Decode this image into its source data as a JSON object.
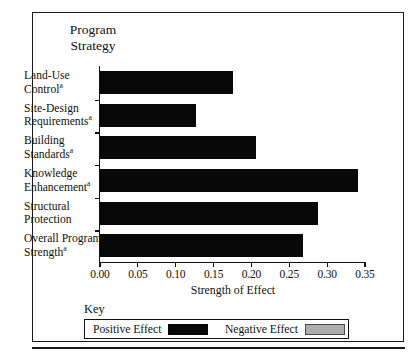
{
  "figure": {
    "corner_title_line1": "Program",
    "corner_title_line2": "Strategy"
  },
  "key": {
    "title": "Key",
    "entries": [
      {
        "label": "Positive Effect",
        "swatch": "positive-swatch",
        "color": "#080808"
      },
      {
        "label": "Negative Effect",
        "swatch": "negative-swatch",
        "color": "#adadad"
      }
    ]
  },
  "chart_data": {
    "type": "bar",
    "orientation": "horizontal",
    "title": "Program Strategy",
    "xlabel": "Strength of Effect",
    "ylabel": "",
    "xlim": [
      0.0,
      0.35
    ],
    "xticks": [
      "0.00",
      "0.05",
      "0.10",
      "0.15",
      "0.20",
      "0.25",
      "0.30",
      "0.35"
    ],
    "xtick_values": [
      0.0,
      0.05,
      0.1,
      0.15,
      0.2,
      0.25,
      0.3,
      0.35
    ],
    "grid": false,
    "legend_position": "bottom",
    "categories": [
      "Land-Use Control",
      "Site-Design Requirements",
      "Building Standards",
      "Knowledge Enhancement",
      "Structural Protection",
      "Overall Program Strength"
    ],
    "category_lines": [
      [
        "Land-Use",
        "Control"
      ],
      [
        "Site-Design",
        "Requirements"
      ],
      [
        "Building",
        "Standards"
      ],
      [
        "Knowledge",
        "Enhancement"
      ],
      [
        "Structural",
        "Protection"
      ],
      [
        "Overall Program",
        "Strength"
      ]
    ],
    "category_footnotes": [
      "a",
      "a",
      "a",
      "a",
      "",
      "a"
    ],
    "values": [
      0.175,
      0.127,
      0.206,
      0.341,
      0.288,
      0.268
    ],
    "effects": [
      "positive",
      "positive",
      "positive",
      "positive",
      "positive",
      "positive"
    ],
    "series": [
      {
        "name": "Positive Effect",
        "values": [
          0.175,
          0.127,
          0.206,
          0.341,
          0.288,
          0.268
        ]
      }
    ]
  }
}
